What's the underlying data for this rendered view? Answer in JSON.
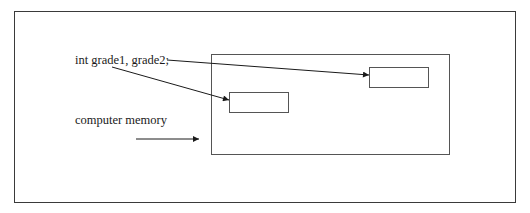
{
  "diagram": {
    "declaration_label": "int grade1, grade2;",
    "memory_label": "computer memory",
    "cells": [
      {
        "name": "grade1",
        "label": ""
      },
      {
        "name": "grade2",
        "label": ""
      }
    ],
    "colors": {
      "line": "#1a1a1a",
      "frame": "#3a3a3a",
      "box": "#555555",
      "background": "#ffffff"
    }
  }
}
